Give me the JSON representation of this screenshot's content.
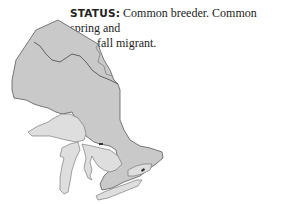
{
  "status": {
    "label": "STATUS:",
    "text_line1": " Common breeder. Common spring and",
    "text_line2": "fall migrant."
  },
  "map": {
    "region": "Ontario",
    "fill_color": "#c8c8c8",
    "lakes_color": "#dcdcdc",
    "border_color": "#555555"
  }
}
